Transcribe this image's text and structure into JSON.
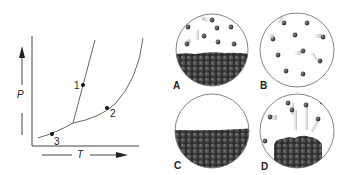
{
  "phase_diagram": {
    "y_axis_label": "P",
    "x_axis_label": "T",
    "points": [
      {
        "label": "1",
        "x": 83,
        "y": 85
      },
      {
        "label": "2",
        "x": 107,
        "y": 108
      },
      {
        "label": "3",
        "x": 52,
        "y": 134
      }
    ]
  },
  "panels": [
    {
      "label": "A",
      "description": "liquid/solid surface with vapor particles above"
    },
    {
      "label": "B",
      "description": "gas particles only"
    },
    {
      "label": "C",
      "description": "condensed phase only"
    },
    {
      "label": "D",
      "description": "solid with particles leaving surface"
    }
  ],
  "colors": {
    "line": "#555555",
    "particle": "#3a3a3a",
    "circle": "#666666"
  }
}
